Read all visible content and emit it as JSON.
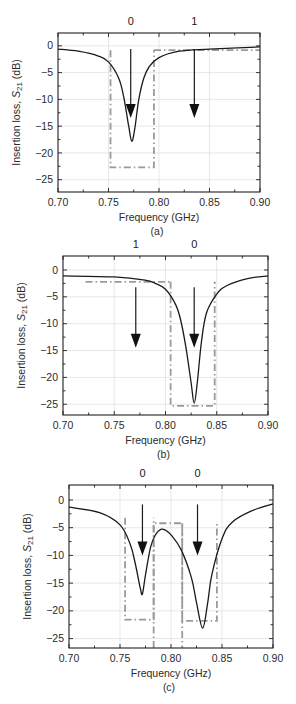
{
  "chart_data": [
    {
      "id": "a",
      "type": "line",
      "caption": "(a)",
      "xlabel": "Frequency (GHz)",
      "ylabel": "Insertion loss, S21 (dB)",
      "xlim": [
        0.7,
        0.9
      ],
      "ylim": [
        -27.3,
        2.4
      ],
      "xticks": [
        0.7,
        0.75,
        0.8,
        0.85,
        0.9
      ],
      "xtick_labels": [
        "0.70",
        "0.75",
        "0.80",
        "0.85",
        "0.90"
      ],
      "yticks": [
        0,
        -5,
        -10,
        -15,
        -20,
        -25
      ],
      "ytick_labels": [
        "0",
        "−5",
        "−10",
        "−15",
        "−20",
        "−25"
      ],
      "grid": true,
      "frame_px": {
        "left": 58,
        "top": 33,
        "right": 260,
        "bottom": 192
      },
      "state_labels": [
        {
          "text": "0",
          "x": 0.772
        },
        {
          "text": "1",
          "x": 0.835
        }
      ],
      "resonances": [
        {
          "f0": 0.773,
          "depth_db": 17.8,
          "width": 0.0085
        }
      ],
      "baseline_db": -0.2,
      "series": [
        {
          "name": "S21",
          "x": [
            0.7,
            0.72,
            0.74,
            0.75,
            0.76,
            0.765,
            0.77,
            0.773,
            0.776,
            0.78,
            0.785,
            0.79,
            0.8,
            0.82,
            0.85,
            0.9
          ],
          "y": [
            -0.6,
            -1.0,
            -1.9,
            -3.0,
            -6.0,
            -9.5,
            -15.0,
            -17.8,
            -15.5,
            -10.0,
            -6.0,
            -4.0,
            -2.2,
            -1.0,
            -0.6,
            -0.2
          ]
        }
      ],
      "masks": [
        {
          "x0": 0.752,
          "x1": 0.795,
          "y_top": -0.8,
          "y_bottom": -22.7,
          "sides": [
            "left",
            "bottom",
            "right"
          ]
        },
        {
          "x0": 0.795,
          "x1": 0.9,
          "y_top": -0.8,
          "sides": [
            "top"
          ]
        }
      ],
      "arrows": [
        {
          "x": 0.772,
          "y_start": -0.6,
          "y_end": -13.5
        },
        {
          "x": 0.835,
          "y_start": -0.6,
          "y_end": -13.5
        }
      ]
    },
    {
      "id": "b",
      "type": "line",
      "caption": "(b)",
      "xlabel": "Frequency (GHz)",
      "ylabel": "Insertion loss, S21 (dB)",
      "xlim": [
        0.7,
        0.9
      ],
      "ylim": [
        -27.0,
        2.6
      ],
      "xticks": [
        0.7,
        0.75,
        0.8,
        0.85,
        0.9
      ],
      "xtick_labels": [
        "0.70",
        "0.75",
        "0.80",
        "0.85",
        "0.90"
      ],
      "yticks": [
        0,
        -5,
        -10,
        -15,
        -20,
        -25
      ],
      "ytick_labels": [
        "0",
        "−5",
        "−10",
        "−15",
        "−20",
        "−25"
      ],
      "grid": true,
      "frame_px": {
        "left": 63,
        "top": 256,
        "right": 268,
        "bottom": 415
      },
      "state_labels": [
        {
          "text": "1",
          "x": 0.771
        },
        {
          "text": "0",
          "x": 0.828
        }
      ],
      "resonances": [
        {
          "f0": 0.828,
          "depth_db": 24.8,
          "width": 0.0075
        }
      ],
      "baseline_db": -1.1,
      "series": [
        {
          "name": "S21",
          "x": [
            0.7,
            0.75,
            0.78,
            0.79,
            0.8,
            0.81,
            0.815,
            0.82,
            0.825,
            0.828,
            0.831,
            0.835,
            0.84,
            0.85,
            0.86,
            0.88,
            0.9
          ],
          "y": [
            -1.1,
            -1.3,
            -1.9,
            -2.5,
            -3.6,
            -6.5,
            -9.5,
            -14.5,
            -21.0,
            -24.8,
            -21.0,
            -13.5,
            -8.0,
            -4.5,
            -2.9,
            -1.6,
            -1.1
          ]
        }
      ],
      "masks": [
        {
          "x0": 0.722,
          "x1": 0.805,
          "y_top": -2.2,
          "sides": [
            "top"
          ]
        },
        {
          "x0": 0.805,
          "x1": 0.848,
          "y_top": -2.2,
          "y_bottom": -25.3,
          "sides": [
            "left",
            "bottom",
            "right"
          ]
        }
      ],
      "arrows": [
        {
          "x": 0.771,
          "y_start": -3.2,
          "y_end": -14.5
        },
        {
          "x": 0.828,
          "y_start": -3.2,
          "y_end": -14.5
        }
      ]
    },
    {
      "id": "c",
      "type": "line",
      "caption": "(c)",
      "xlabel": "Frequency (GHz)",
      "ylabel": "Insertion loss, S21 (dB)",
      "xlim": [
        0.7,
        0.9
      ],
      "ylim": [
        -26.7,
        2.7
      ],
      "xticks": [
        0.7,
        0.75,
        0.8,
        0.85,
        0.9
      ],
      "xtick_labels": [
        "0.70",
        "0.75",
        "0.80",
        "0.85",
        "0.90"
      ],
      "yticks": [
        0,
        -5,
        -10,
        -15,
        -20,
        -25
      ],
      "ytick_labels": [
        "0",
        "−5",
        "−10",
        "−15",
        "−20",
        "−25"
      ],
      "grid": true,
      "frame_px": {
        "left": 69,
        "top": 485,
        "right": 273,
        "bottom": 648
      },
      "state_labels": [
        {
          "text": "0",
          "x": 0.772
        },
        {
          "text": "0",
          "x": 0.826
        }
      ],
      "resonances": [
        {
          "f0": 0.772,
          "depth_db": 16.9,
          "width": 0.0065
        },
        {
          "f0": 0.831,
          "depth_db": 23.1,
          "width": 0.0085
        }
      ],
      "baseline_db": -0.6,
      "series": [
        {
          "name": "S21",
          "x": [
            0.7,
            0.73,
            0.75,
            0.76,
            0.765,
            0.77,
            0.772,
            0.775,
            0.78,
            0.785,
            0.79,
            0.795,
            0.8,
            0.81,
            0.82,
            0.825,
            0.831,
            0.836,
            0.84,
            0.85,
            0.86,
            0.88,
            0.9
          ],
          "y": [
            -1.3,
            -2.3,
            -4.5,
            -8.0,
            -11.5,
            -16.0,
            -16.9,
            -13.5,
            -8.5,
            -6.2,
            -5.3,
            -5.5,
            -6.3,
            -9.0,
            -14.0,
            -18.5,
            -23.1,
            -18.5,
            -13.5,
            -7.0,
            -4.0,
            -1.9,
            -0.7
          ]
        }
      ],
      "masks": [
        {
          "x0": 0.755,
          "x1": 0.783,
          "y_top": -3.2,
          "y_bottom": -21.6,
          "sides": [
            "left",
            "bottom",
            "right"
          ]
        },
        {
          "x0": 0.783,
          "x1": 0.811,
          "y_top": -4.2,
          "sides": [
            "left",
            "top",
            "right"
          ]
        },
        {
          "x0": 0.811,
          "x1": 0.845,
          "y_top": -4.2,
          "y_bottom": -21.8,
          "sides": [
            "left",
            "bottom",
            "right"
          ]
        }
      ],
      "arrows": [
        {
          "x": 0.772,
          "y_start": -0.8,
          "y_end": -10.0
        },
        {
          "x": 0.826,
          "y_start": -0.8,
          "y_end": -10.0
        }
      ]
    }
  ]
}
